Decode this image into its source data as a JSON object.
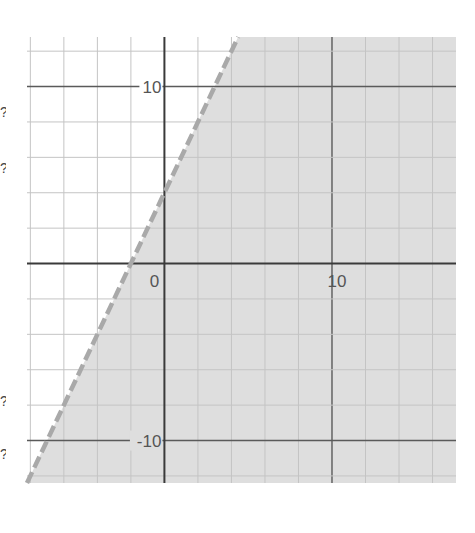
{
  "chart_data": {
    "type": "line",
    "title": "",
    "xlabel": "",
    "ylabel": "",
    "inequality": "y < 2x + 4",
    "boundary": {
      "slope": 2,
      "intercept": 4,
      "style": "dashed",
      "x_intercept": -2,
      "y_intercept": 4
    },
    "shaded_region": "below line (right side)",
    "xlim": [
      -8.2,
      17.4
    ],
    "ylim": [
      -12.4,
      12.8
    ],
    "grid": true,
    "grid_step": 2,
    "major_step": 10,
    "x_tick_labels": [
      {
        "value": 0,
        "label": "0"
      },
      {
        "value": 10,
        "label": "10"
      }
    ],
    "y_tick_labels": [
      {
        "value": 10,
        "label": "10"
      },
      {
        "value": -10,
        "label": "-10"
      }
    ],
    "series": [
      {
        "name": "boundary",
        "x": [
          -8.2,
          4.4
        ],
        "y": [
          -12.4,
          12.8
        ]
      }
    ]
  },
  "colors": {
    "background": "#ffffff",
    "shade": "#dedede",
    "boundary": "#a9a9a9",
    "minor_grid": "#c4c4c4",
    "major_grid": "#5a5a5a",
    "axis": "#3a3a3a",
    "label": "#555555"
  },
  "layout": {
    "plot": {
      "left": 27,
      "top": 37,
      "right": 456,
      "bottom": 483
    }
  }
}
